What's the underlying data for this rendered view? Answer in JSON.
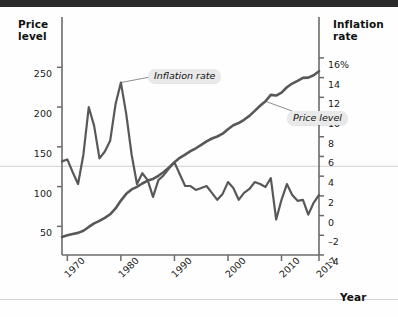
{
  "axes": {
    "left_title": "Price\nlevel",
    "left_title_line1": "Price",
    "left_title_line2": "level",
    "right_title_line1": "Inflation",
    "right_title_line2": "rate",
    "x_title": "Year",
    "left_ticks": [
      "250",
      "200",
      "150",
      "100",
      "50"
    ],
    "right_ticks": [
      "16%",
      "14",
      "12",
      "10",
      "8",
      "6",
      "4",
      "2",
      "0",
      "–2",
      "–4"
    ],
    "x_ticks": [
      "1970",
      "1980",
      "1990",
      "2000",
      "2010",
      "2017"
    ]
  },
  "callouts": {
    "inflation": "Inflation rate",
    "price": "Price level"
  },
  "colors": {
    "line": "#585858",
    "gridline": "#d9d9d9",
    "axis": "#6b6b6b",
    "callout_bg": "#e9e9e9",
    "topbar": "#2b2b2b",
    "text": "#111111"
  },
  "chart_data": {
    "type": "line",
    "title": "",
    "subtitle": "",
    "xlabel": "Year",
    "ylabel": "Price level",
    "y2label": "Inflation rate",
    "grid": true,
    "gridlines": [
      {
        "axis": "y2",
        "value": 5
      }
    ],
    "legend_position": "inline-callouts",
    "xlim": [
      1969,
      2017
    ],
    "ylim": [
      14,
      268
    ],
    "y2lim": [
      -4,
      16.5
    ],
    "x": [
      1969,
      1970,
      1971,
      1972,
      1973,
      1974,
      1975,
      1976,
      1977,
      1978,
      1979,
      1980,
      1981,
      1982,
      1983,
      1984,
      1985,
      1986,
      1987,
      1988,
      1989,
      1990,
      1991,
      1992,
      1993,
      1994,
      1995,
      1996,
      1997,
      1998,
      1999,
      2000,
      2001,
      2002,
      2003,
      2004,
      2005,
      2006,
      2007,
      2008,
      2009,
      2010,
      2011,
      2012,
      2013,
      2014,
      2015,
      2016,
      2017
    ],
    "series": [
      {
        "name": "Price level",
        "axis": "left",
        "units": "index",
        "values": [
          36.7,
          38.8,
          40.5,
          41.8,
          44.4,
          49.3,
          53.8,
          56.9,
          60.6,
          65.2,
          72.6,
          82.4,
          90.9,
          96.5,
          99.6,
          103.9,
          107.6,
          109.6,
          113.6,
          118.3,
          124.0,
          130.7,
          136.2,
          140.3,
          144.5,
          148.2,
          152.4,
          156.9,
          160.5,
          163.0,
          166.6,
          172.2,
          177.1,
          179.9,
          184.0,
          188.9,
          195.3,
          201.6,
          207.3,
          215.3,
          214.5,
          218.1,
          224.9,
          229.6,
          233.0,
          236.7,
          237.0,
          240.0,
          245.1
        ]
      },
      {
        "name": "Inflation rate",
        "axis": "right",
        "units": "percent",
        "values": [
          5.5,
          5.7,
          4.4,
          3.2,
          6.2,
          11.0,
          9.1,
          5.8,
          6.5,
          7.6,
          11.3,
          13.5,
          10.3,
          6.2,
          3.2,
          4.3,
          3.6,
          1.9,
          3.6,
          4.1,
          4.8,
          5.4,
          4.2,
          3.0,
          3.0,
          2.6,
          2.8,
          3.0,
          2.3,
          1.6,
          2.2,
          3.4,
          2.8,
          1.6,
          2.3,
          2.7,
          3.4,
          3.2,
          2.9,
          3.8,
          -0.4,
          1.6,
          3.2,
          2.1,
          1.5,
          1.6,
          0.1,
          1.3,
          2.1
        ]
      }
    ],
    "annotations": [
      {
        "text": "Inflation rate",
        "series": "Inflation rate",
        "anchor_x": 1980,
        "anchor_y": 13.5
      },
      {
        "text": "Price level",
        "series": "Price level",
        "anchor_x": 2007,
        "anchor_y": 207.3
      }
    ]
  }
}
